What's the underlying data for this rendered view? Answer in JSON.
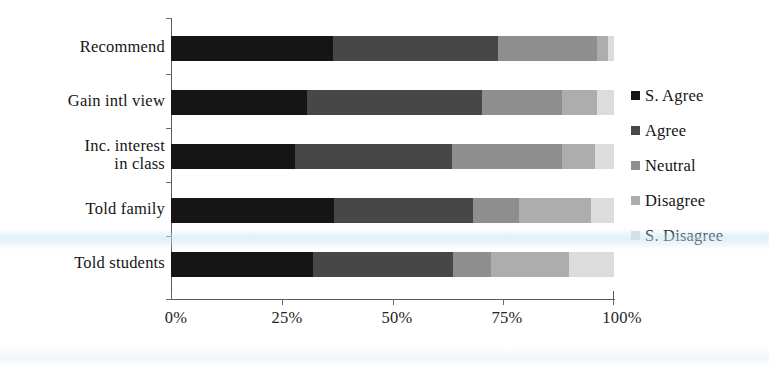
{
  "chart_data": {
    "type": "bar",
    "orientation": "horizontal",
    "stacked": true,
    "normalized": "percent",
    "title": "",
    "xlabel": "",
    "ylabel": "",
    "xlim": [
      0,
      100
    ],
    "grid": false,
    "legend_position": "right",
    "categories": [
      "Recommend",
      "Gain intl view",
      "Inc. interest\nin class",
      "Told family",
      "Told students"
    ],
    "xticks": [
      0,
      25,
      50,
      75,
      100
    ],
    "xticklabels": [
      "0%",
      "25%",
      "50%",
      "75%",
      "100%"
    ],
    "series": [
      {
        "name": "S. Agree",
        "color": "#151515",
        "values": [
          36.5,
          30.7,
          28.0,
          36.9,
          32.0
        ]
      },
      {
        "name": "Agree",
        "color": "#474747",
        "values": [
          37.3,
          39.6,
          35.4,
          31.2,
          31.6
        ]
      },
      {
        "name": "Neutral",
        "color": "#8e8e8e",
        "values": [
          22.4,
          17.9,
          24.9,
          10.5,
          8.6
        ]
      },
      {
        "name": "Disagree",
        "color": "#adadad",
        "values": [
          2.5,
          7.9,
          7.4,
          16.2,
          17.7
        ]
      },
      {
        "name": "S. Disagree",
        "color": "#dcdcdc",
        "values": [
          1.3,
          3.9,
          4.3,
          5.2,
          10.1
        ]
      }
    ]
  },
  "legend": {
    "items": [
      {
        "label": "S. Agree"
      },
      {
        "label": "Agree"
      },
      {
        "label": "Neutral"
      },
      {
        "label": "Disagree"
      },
      {
        "label": "S. Disagree"
      }
    ]
  }
}
